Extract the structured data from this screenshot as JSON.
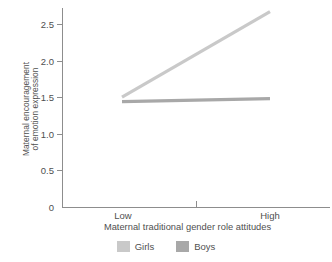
{
  "chart_data": {
    "type": "line",
    "title": "",
    "xlabel": "Maternal traditional gender role attitudes",
    "ylabel_line1": "Maternal encouragement",
    "ylabel_line2": "of emotion expression",
    "categories": [
      "Low",
      "High"
    ],
    "yticks": [
      "0",
      "0.5",
      "1.0",
      "1.5",
      "2.0",
      "2.5"
    ],
    "ytick_values": [
      0,
      0.5,
      1.0,
      1.5,
      2.0,
      2.5
    ],
    "ylim": [
      0,
      2.72
    ],
    "grid": false,
    "legend_position": "bottom",
    "series": [
      {
        "name": "Girls",
        "values": [
          1.5,
          2.67
        ],
        "color": "#c9c9c9"
      },
      {
        "name": "Boys",
        "values": [
          1.44,
          1.48
        ],
        "color": "#a8a8a8"
      }
    ]
  },
  "legend": {
    "items": [
      {
        "label": "Girls",
        "color": "#c9c9c9"
      },
      {
        "label": "Boys",
        "color": "#a8a8a8"
      }
    ]
  }
}
